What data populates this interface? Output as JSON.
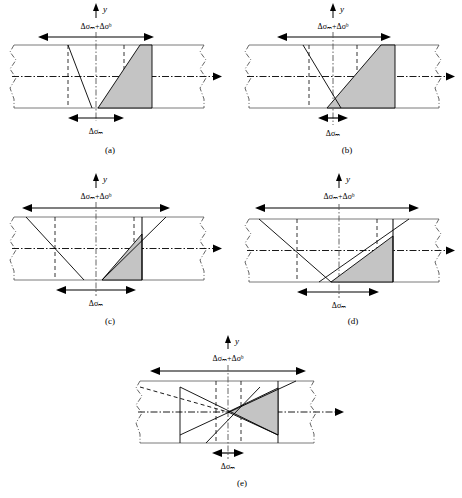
{
  "figure": {
    "type": "stress-distribution-diagram",
    "axis_label_y": "y",
    "label_total_stress": "Δσₘ+Δσᵇ",
    "label_membrane_stress": "Δσₘ",
    "colors": {
      "shade_fill": "#c4c4c4",
      "line": "#000000",
      "outline_gray": "#808080"
    },
    "subfigures": [
      {
        "id": "a",
        "caption": "(a)",
        "top_label": "Δσₘ+Δσᵇ",
        "bottom_label": "Δσₘ",
        "top_arrow_span_px": 110,
        "bottom_arrow_span_px": 56
      },
      {
        "id": "b",
        "caption": "(b)",
        "top_label": "Δσₘ+Δσᵇ",
        "bottom_label": "Δσₘ",
        "top_arrow_span_px": 110,
        "bottom_arrow_span_px": 26
      },
      {
        "id": "c",
        "caption": "(c)",
        "top_label": "Δσₘ+Δσᵇ",
        "bottom_label": "Δσₘ",
        "top_arrow_span_px": 150,
        "bottom_arrow_span_px": 76
      },
      {
        "id": "d",
        "caption": "(d)",
        "top_label": "Δσₘ+Δσᵇ",
        "bottom_label": "Δσₘ",
        "top_arrow_span_px": 160,
        "bottom_arrow_span_px": 76
      },
      {
        "id": "e",
        "caption": "(e)",
        "top_label": "Δσₘ+Δσᵇ",
        "bottom_label": "Δσₘ",
        "top_arrow_span_px": 155,
        "bottom_arrow_span_px": 30
      }
    ]
  }
}
